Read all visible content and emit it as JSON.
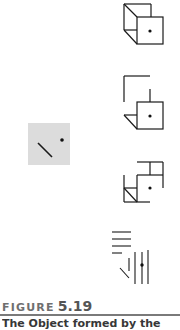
{
  "figure": {
    "label_word": "FIGURE",
    "label_number": "5.19",
    "caption_fragment": "The Object  formed   by  the"
  },
  "colors": {
    "stroke": "#1a1a1a",
    "stimulus_background": "#dcdcdc",
    "label_grey": "#6f6f6f",
    "rule": "#7a7a7a"
  },
  "panels": [
    {
      "id": "stimulus",
      "description": "grey square with diagonal line and dot"
    },
    {
      "id": "cube-complete",
      "description": "full cube outline with dot on front face"
    },
    {
      "id": "cube-partial-1",
      "description": "partial cube with corner and front face"
    },
    {
      "id": "cube-partial-2",
      "description": "partial cube with stepped outline"
    },
    {
      "id": "line-fragments",
      "description": "disjoint horizontal and vertical line fragments"
    }
  ]
}
